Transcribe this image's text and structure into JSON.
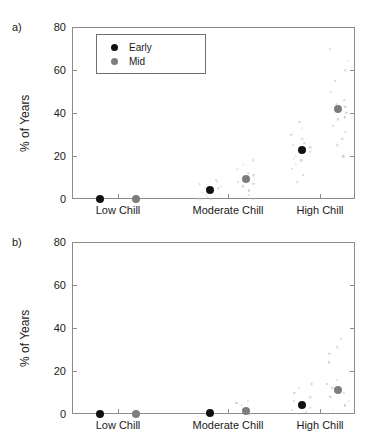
{
  "figure": {
    "width": 371,
    "height": 442,
    "background": "#ffffff"
  },
  "colors": {
    "early_marker": "#111111",
    "mid_marker": "#7d7d7d",
    "scatter_cloud": "#c9c9c9",
    "axis": "#8c8c8c",
    "text": "#1a1a1a"
  },
  "legend": {
    "position": "upper-left-inside-panel-a",
    "entries": [
      {
        "label": "Early",
        "color": "#111111",
        "icon": "filled-circle-marker"
      },
      {
        "label": "Mid",
        "color": "#7d7d7d",
        "icon": "filled-circle-marker"
      }
    ]
  },
  "panels": [
    {
      "id": "a",
      "label": "a)"
    },
    {
      "id": "b",
      "label": "b)"
    }
  ],
  "chart_data": [
    {
      "type": "scatter",
      "panel": "a",
      "panel_label": "a)",
      "title": "",
      "xlabel": "",
      "ylabel": "% of Years",
      "categories": [
        "Low Chill",
        "Moderate Chill",
        "High Chill"
      ],
      "ylim": [
        0,
        80
      ],
      "yticks": [
        0,
        20,
        40,
        60,
        80
      ],
      "ytick_labels": [
        "0",
        "20",
        "40",
        "60",
        "80"
      ],
      "grid": false,
      "legend": [
        "Early",
        "Mid"
      ],
      "series": [
        {
          "name": "Early",
          "color": "#111111",
          "values": [
            0,
            4,
            23
          ]
        },
        {
          "name": "Mid",
          "color": "#7d7d7d",
          "values": [
            0,
            9.5,
            42
          ]
        }
      ],
      "scatter_cloud": {
        "color": "#c9c9c9",
        "note": "faint individual-year points around each mean marker",
        "points": [
          {
            "category": "Moderate Chill",
            "series": "Early",
            "values": [
              0,
              0,
              1,
              2,
              3,
              4,
              5,
              6,
              7,
              8,
              9,
              2,
              5
            ]
          },
          {
            "category": "Moderate Chill",
            "series": "Mid",
            "values": [
              0,
              2,
              4,
              6,
              8,
              10,
              12,
              14,
              16,
              18,
              7,
              11
            ]
          },
          {
            "category": "High Chill",
            "series": "Early",
            "values": [
              8,
              11,
              14,
              16,
              18,
              20,
              22,
              24,
              26,
              28,
              30,
              33,
              36,
              19,
              25
            ]
          },
          {
            "category": "High Chill",
            "series": "Mid",
            "values": [
              20,
              25,
              28,
              31,
              34,
              37,
              40,
              43,
              46,
              50,
              55,
              60,
              64,
              70,
              38,
              44
            ]
          }
        ]
      }
    },
    {
      "type": "scatter",
      "panel": "b",
      "panel_label": "b)",
      "title": "",
      "xlabel": "",
      "ylabel": "% of Years",
      "categories": [
        "Low Chill",
        "Moderate Chill",
        "High Chill"
      ],
      "ylim": [
        0,
        80
      ],
      "yticks": [
        0,
        20,
        40,
        60,
        80
      ],
      "ytick_labels": [
        "0",
        "20",
        "40",
        "60",
        "80"
      ],
      "grid": false,
      "legend": [],
      "series": [
        {
          "name": "Early",
          "color": "#111111",
          "values": [
            0,
            0.3,
            4
          ]
        },
        {
          "name": "Mid",
          "color": "#7d7d7d",
          "values": [
            0,
            1.2,
            11
          ]
        }
      ],
      "scatter_cloud": {
        "color": "#c9c9c9",
        "note": "faint individual-year points around each mean marker",
        "points": [
          {
            "category": "Moderate Chill",
            "series": "Mid",
            "values": [
              0,
              1,
              2,
              3,
              4,
              5,
              6
            ]
          },
          {
            "category": "High Chill",
            "series": "Early",
            "values": [
              0,
              1,
              2,
              3,
              4,
              5,
              6,
              8,
              10,
              12,
              14
            ]
          },
          {
            "category": "High Chill",
            "series": "Mid",
            "values": [
              2,
              4,
              6,
              8,
              10,
              12,
              14,
              16,
              20,
              24,
              28,
              31,
              35
            ]
          }
        ]
      }
    }
  ]
}
